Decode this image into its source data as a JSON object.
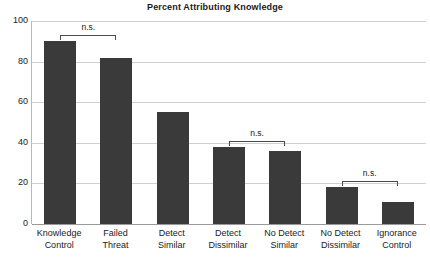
{
  "chart_data": {
    "type": "bar",
    "title": "Percent Attributing Knowledge",
    "xlabel": "",
    "ylabel": "",
    "ylim": [
      0,
      100
    ],
    "yticks": [
      0,
      20,
      40,
      60,
      80,
      100
    ],
    "ytick_labels": [
      "0",
      "20",
      "40",
      "60",
      "80",
      "100"
    ],
    "grid": true,
    "legend": "none",
    "bar_color": "#3a3a3a",
    "categories": [
      "Knowledge\nControl",
      "Failed\nThreat",
      "Detect\nSimilar",
      "Detect\nDissimilar",
      "No Detect\nSimilar",
      "No Detect\nDissimilar",
      "Ignorance\nControl"
    ],
    "category_lines": [
      [
        "Knowledge",
        "Control"
      ],
      [
        "Failed",
        "Threat"
      ],
      [
        "Detect",
        "Similar"
      ],
      [
        "Detect",
        "Dissimilar"
      ],
      [
        "No Detect",
        "Similar"
      ],
      [
        "No Detect",
        "Dissimilar"
      ],
      [
        "Ignorance",
        "Control"
      ]
    ],
    "values": [
      90,
      82,
      55,
      38,
      36,
      18,
      11
    ],
    "annotations": [
      {
        "label": "n.s.",
        "from_index": 0,
        "to_index": 1,
        "y": 93
      },
      {
        "label": "n.s.",
        "from_index": 3,
        "to_index": 4,
        "y": 41
      },
      {
        "label": "n.s.",
        "from_index": 5,
        "to_index": 6,
        "y": 21
      }
    ]
  }
}
